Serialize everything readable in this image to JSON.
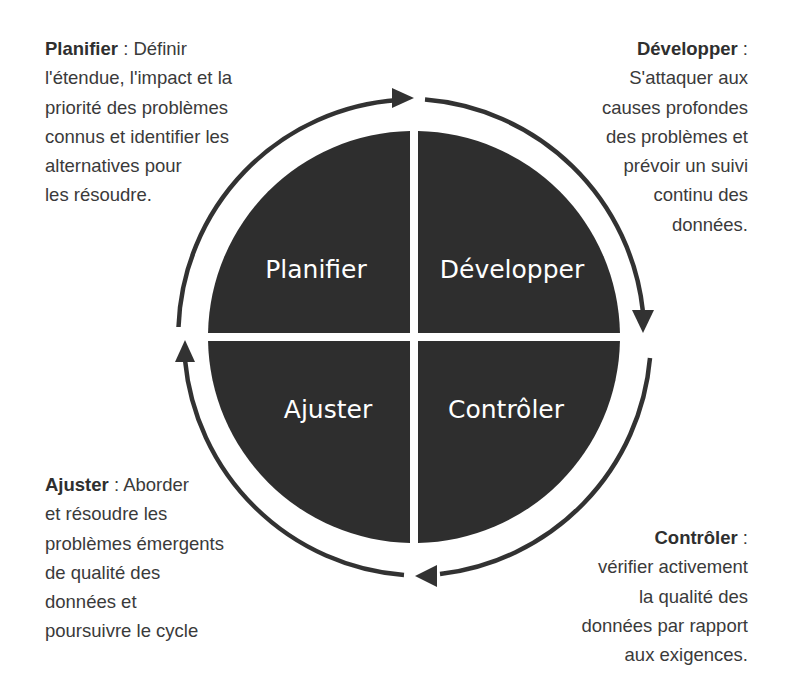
{
  "diagram": {
    "colors": {
      "quadrant_fill": "#2e2e2e",
      "arrow": "#333333",
      "quadrant_text": "#ffffff",
      "body_text": "#3a3a3a"
    },
    "quadrants": [
      {
        "id": "planifier",
        "label": "Planifier",
        "position": "top-left"
      },
      {
        "id": "developper",
        "label": "Développer",
        "position": "top-right"
      },
      {
        "id": "ajuster",
        "label": "Ajuster",
        "position": "bottom-left"
      },
      {
        "id": "controler",
        "label": "Contrôler",
        "position": "bottom-right"
      }
    ],
    "cycle_direction": "clockwise",
    "descriptions": {
      "planifier": {
        "term": "Planifier",
        "sep": " : ",
        "lines": [
          "Définir",
          "l'étendue, l'impact et la",
          "priorité des problèmes",
          "connus et identifier les",
          "alternatives pour",
          "les résoudre."
        ]
      },
      "developper": {
        "term": "Développer",
        "sep": " :",
        "lines": [
          "",
          "S'attaquer aux",
          "causes profondes",
          "des problèmes et",
          "prévoir un suivi",
          "continu des",
          "données."
        ]
      },
      "ajuster": {
        "term": "Ajuster",
        "sep": " : ",
        "lines": [
          "Aborder",
          "et résoudre les",
          "problèmes émergents",
          "de qualité des",
          "données et",
          "poursuivre le cycle"
        ]
      },
      "controler": {
        "term": "Contrôler",
        "sep": " :",
        "lines": [
          "",
          "vérifier activement",
          "la qualité des",
          "données par rapport",
          "aux exigences."
        ]
      }
    }
  }
}
